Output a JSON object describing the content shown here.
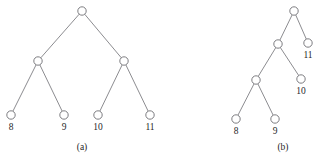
{
  "figure": {
    "panels": [
      {
        "id": "panel-a",
        "caption": "(a)",
        "caption_pos": {
          "x": 82,
          "y": 148
        },
        "nodes": [
          {
            "id": "a-root",
            "label": "",
            "x": 82,
            "y": 11,
            "r": 4.2
          },
          {
            "id": "a-n1",
            "label": "",
            "x": 38,
            "y": 61,
            "r": 4.2
          },
          {
            "id": "a-n2",
            "label": "",
            "x": 124,
            "y": 61,
            "r": 4.2
          },
          {
            "id": "a-leaf8",
            "label": "8",
            "x": 11,
            "y": 115,
            "r": 4.2
          },
          {
            "id": "a-leaf9",
            "label": "9",
            "x": 64,
            "y": 115,
            "r": 4.2
          },
          {
            "id": "a-leaf10",
            "label": "10",
            "x": 98,
            "y": 115,
            "r": 4.2
          },
          {
            "id": "a-leaf11",
            "label": "11",
            "x": 150,
            "y": 115,
            "r": 4.2
          }
        ],
        "edges": [
          {
            "from": "a-root",
            "to": "a-n1"
          },
          {
            "from": "a-root",
            "to": "a-n2"
          },
          {
            "from": "a-n1",
            "to": "a-leaf8"
          },
          {
            "from": "a-n1",
            "to": "a-leaf9"
          },
          {
            "from": "a-n2",
            "to": "a-leaf10"
          },
          {
            "from": "a-n2",
            "to": "a-leaf11"
          }
        ]
      },
      {
        "id": "panel-b",
        "caption": "(b)",
        "caption_pos": {
          "x": 283,
          "y": 148
        },
        "nodes": [
          {
            "id": "b-root",
            "label": "",
            "x": 294,
            "y": 11,
            "r": 4.2
          },
          {
            "id": "b-n1",
            "label": "",
            "x": 278,
            "y": 44,
            "r": 4.2
          },
          {
            "id": "b-leaf11",
            "label": "11",
            "x": 308,
            "y": 43,
            "r": 4.2
          },
          {
            "id": "b-n2",
            "label": "",
            "x": 256,
            "y": 80,
            "r": 4.2
          },
          {
            "id": "b-leaf10",
            "label": "10",
            "x": 301,
            "y": 79,
            "r": 4.2
          },
          {
            "id": "b-leaf8",
            "label": "8",
            "x": 236,
            "y": 119,
            "r": 4.2
          },
          {
            "id": "b-leaf9",
            "label": "9",
            "x": 275,
            "y": 119,
            "r": 4.2
          }
        ],
        "edges": [
          {
            "from": "b-root",
            "to": "b-n1"
          },
          {
            "from": "b-root",
            "to": "b-leaf11"
          },
          {
            "from": "b-n1",
            "to": "b-n2"
          },
          {
            "from": "b-n1",
            "to": "b-leaf10"
          },
          {
            "from": "b-n2",
            "to": "b-leaf8"
          },
          {
            "from": "b-n2",
            "to": "b-leaf9"
          }
        ]
      }
    ],
    "label_offset_y": 13,
    "colors": {
      "background": "#ffffff",
      "stroke": "#6e6e73",
      "node_fill": "#ffffff",
      "text": "#1f1f1f"
    }
  }
}
